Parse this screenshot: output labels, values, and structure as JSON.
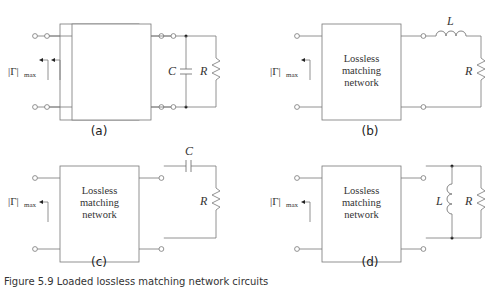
{
  "figure": {
    "caption": "Figure 5.9  Loaded lossless matching network circuits",
    "panels": [
      {
        "id": "a",
        "label": "(a)",
        "box_lines": [
          "Lossless",
          "matching",
          "network"
        ],
        "load": "parallel C and R",
        "components": [
          "C",
          "R"
        ],
        "reflection_label": "|Γ|",
        "reflection_sub": "max"
      },
      {
        "id": "b",
        "label": "(b)",
        "box_lines": [
          "Lossless",
          "matching",
          "network"
        ],
        "load": "series L and R",
        "components": [
          "L",
          "R"
        ],
        "reflection_label": "|Γ|",
        "reflection_sub": "max"
      },
      {
        "id": "c",
        "label": "(c)",
        "box_lines": [
          "Lossless",
          "matching",
          "network"
        ],
        "load": "series C and R",
        "components": [
          "C",
          "R"
        ],
        "reflection_label": "|Γ|",
        "reflection_sub": "max"
      },
      {
        "id": "d",
        "label": "(d)",
        "box_lines": [
          "Lossless",
          "matching",
          "network"
        ],
        "load": "parallel L and R",
        "components": [
          "L",
          "R"
        ],
        "reflection_label": "|Γ|",
        "reflection_sub": "max"
      }
    ]
  }
}
